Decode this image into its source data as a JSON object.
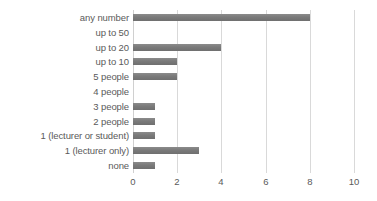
{
  "chart_data": {
    "type": "bar",
    "orientation": "horizontal",
    "title": "",
    "xlabel": "",
    "ylabel": "",
    "xlim": [
      0,
      10
    ],
    "xticks": [
      0,
      2,
      4,
      6,
      8,
      10
    ],
    "xtick_labels": [
      "0",
      "2",
      "4",
      "6",
      "8",
      "10"
    ],
    "grid": true,
    "legend": false,
    "categories": [
      "any number",
      "up to 50",
      "up to 20",
      "up to 10",
      "5 people",
      "4 people",
      "3 people",
      "2 people",
      "1 (lecturer or student)",
      "1 (lecturer only)",
      "none"
    ],
    "values": [
      8,
      0,
      4,
      2,
      2,
      0,
      1,
      1,
      1,
      3,
      1
    ],
    "bar_color": "#7a7a7a",
    "gridline_color": "#d9d9d9",
    "text_color": "#5a5a5a"
  }
}
